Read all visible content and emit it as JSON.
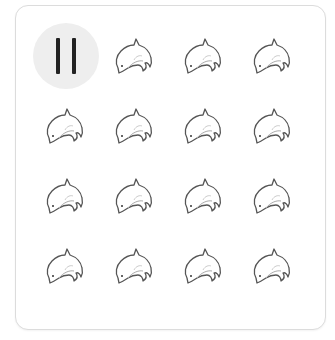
{
  "game": {
    "title": "Dolphin grid",
    "colors": {
      "card_border": "#dcdcdc",
      "pause_bg": "#eeeeee",
      "pause_bar": "#222222",
      "dolphin_stroke": "#555555"
    },
    "pause_button": {
      "icon": "pause-icon",
      "state": "paused"
    },
    "grid": {
      "rows": 4,
      "cols": 4,
      "tiles": [
        {
          "type": "pause"
        },
        {
          "type": "dolphin"
        },
        {
          "type": "dolphin"
        },
        {
          "type": "dolphin"
        },
        {
          "type": "dolphin"
        },
        {
          "type": "dolphin"
        },
        {
          "type": "dolphin"
        },
        {
          "type": "dolphin"
        },
        {
          "type": "dolphin"
        },
        {
          "type": "dolphin"
        },
        {
          "type": "dolphin"
        },
        {
          "type": "dolphin"
        },
        {
          "type": "dolphin"
        },
        {
          "type": "dolphin"
        },
        {
          "type": "dolphin"
        },
        {
          "type": "dolphin"
        }
      ]
    }
  }
}
